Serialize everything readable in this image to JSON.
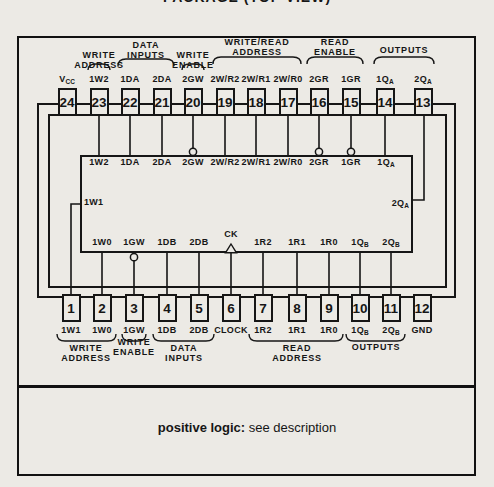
{
  "title": "PACKAGE (TOP VIEW)",
  "footer": {
    "bold": "positive logic:",
    "rest": " see description"
  },
  "colors": {
    "ink": "#161616",
    "paper": "#eceae5"
  },
  "ic": {
    "top_pins": [
      {
        "num": "24",
        "label": "V",
        "sub": "CC"
      },
      {
        "num": "23",
        "label": "1W2",
        "sub": ""
      },
      {
        "num": "22",
        "label": "1DA",
        "sub": ""
      },
      {
        "num": "21",
        "label": "2DA",
        "sub": ""
      },
      {
        "num": "20",
        "label": "2GW",
        "sub": ""
      },
      {
        "num": "19",
        "label": "2W/R2",
        "sub": ""
      },
      {
        "num": "18",
        "label": "2W/R1",
        "sub": ""
      },
      {
        "num": "17",
        "label": "2W/R0",
        "sub": ""
      },
      {
        "num": "16",
        "label": "2GR",
        "sub": ""
      },
      {
        "num": "15",
        "label": "1GR",
        "sub": ""
      },
      {
        "num": "14",
        "label": "1Q",
        "sub": "A"
      },
      {
        "num": "13",
        "label": "2Q",
        "sub": "A"
      }
    ],
    "bottom_pins": [
      {
        "num": "1",
        "label": "1W1",
        "sub": ""
      },
      {
        "num": "2",
        "label": "1W0",
        "sub": ""
      },
      {
        "num": "3",
        "label": "1GW",
        "sub": ""
      },
      {
        "num": "4",
        "label": "1DB",
        "sub": ""
      },
      {
        "num": "5",
        "label": "2DB",
        "sub": ""
      },
      {
        "num": "6",
        "label": "CLOCK",
        "sub": ""
      },
      {
        "num": "7",
        "label": "1R2",
        "sub": ""
      },
      {
        "num": "8",
        "label": "1R1",
        "sub": ""
      },
      {
        "num": "9",
        "label": "1R0",
        "sub": ""
      },
      {
        "num": "10",
        "label": "1Q",
        "sub": "B"
      },
      {
        "num": "11",
        "label": "2Q",
        "sub": "B"
      },
      {
        "num": "12",
        "label": "GND",
        "sub": ""
      }
    ],
    "top_groups": [
      {
        "line1": "WRITE",
        "line2": "ADDRESS"
      },
      {
        "line1": "DATA",
        "line2": "INPUTS"
      },
      {
        "line1": "WRITE",
        "line2": "ENABLE"
      },
      {
        "line1": "WRITE/READ",
        "line2": "ADDRESS"
      },
      {
        "line1": "READ",
        "line2": "ENABLE"
      },
      {
        "line1": "OUTPUTS",
        "line2": ""
      }
    ],
    "bottom_groups": [
      {
        "line1": "WRITE",
        "line2": "ADDRESS"
      },
      {
        "line1": "WRITE",
        "line2": "ENABLE"
      },
      {
        "line1": "DATA",
        "line2": "INPUTS"
      },
      {
        "line1": "READ",
        "line2": "ADDRESS"
      },
      {
        "line1": "OUTPUTS",
        "line2": ""
      }
    ],
    "block": {
      "top_labels": [
        {
          "label": "1W2",
          "sub": ""
        },
        {
          "label": "1DA",
          "sub": ""
        },
        {
          "label": "2DA",
          "sub": ""
        },
        {
          "label": "2GW",
          "sub": ""
        },
        {
          "label": "2W/R2",
          "sub": ""
        },
        {
          "label": "2W/R1",
          "sub": ""
        },
        {
          "label": "2W/R0",
          "sub": ""
        },
        {
          "label": "2GR",
          "sub": ""
        },
        {
          "label": "1GR",
          "sub": ""
        },
        {
          "label": "1Q",
          "sub": "A"
        }
      ],
      "bottom_labels": [
        {
          "label": "1W0",
          "sub": ""
        },
        {
          "label": "1GW",
          "sub": ""
        },
        {
          "label": "1DB",
          "sub": ""
        },
        {
          "label": "2DB",
          "sub": ""
        },
        {
          "label": "CK",
          "sub": ""
        },
        {
          "label": "1R2",
          "sub": ""
        },
        {
          "label": "1R1",
          "sub": ""
        },
        {
          "label": "1R0",
          "sub": ""
        },
        {
          "label": "1Q",
          "sub": "B"
        },
        {
          "label": "2Q",
          "sub": "B"
        }
      ],
      "left_label": {
        "label": "1W1",
        "sub": ""
      },
      "right_label": {
        "label": "2Q",
        "sub": "A"
      }
    }
  }
}
